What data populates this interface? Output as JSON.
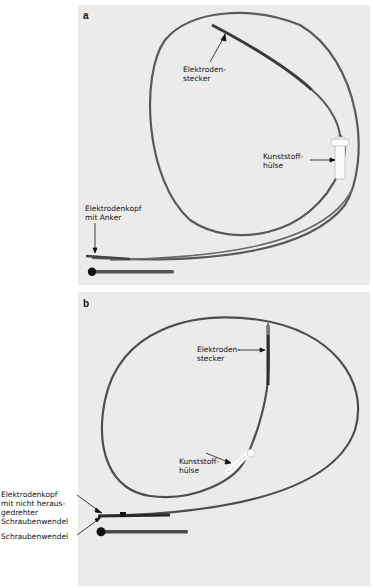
{
  "figure": {
    "panels": [
      {
        "letter": "a",
        "labels": {
          "connector": "Elektroden-\nstecker",
          "sleeve": "Kunststoff-\nhülse",
          "head": "Elektrodenkopf\nmit Anker"
        }
      },
      {
        "letter": "b",
        "labels": {
          "connector": "Elektroden-\nstecker",
          "sleeve": "Kunststoff-\nhülse",
          "head": "Elektrodenkopf\nmit nicht heraus-\ngedrehter\nSchraubenwendel",
          "helix": "Schraubenwendel"
        }
      }
    ]
  },
  "colors": {
    "photo_background": "#ecebea",
    "lead": "#5a5a5a",
    "lead_dark": "#2e2e2e",
    "sleeve": "#fafafa",
    "text": "#111111"
  }
}
